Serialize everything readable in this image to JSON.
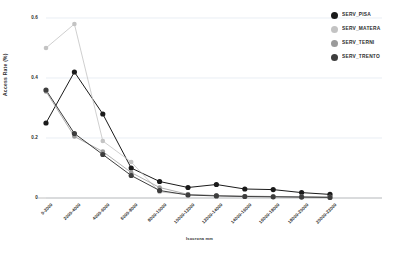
{
  "chart_data": {
    "type": "line",
    "title": "",
    "xlabel": "Isocrona mm",
    "ylabel": "Access Rate (%)",
    "ylim": [
      0,
      0.6
    ],
    "yticks": [
      0,
      0.2,
      0.4,
      0.6
    ],
    "ytick_labels": [
      "0",
      "0.2",
      "0.4",
      "0.6"
    ],
    "grid": "horizontal",
    "legend_position": "top-right",
    "categories": [
      "0-2000",
      "2000-4000",
      "4000-6000",
      "6000-8000",
      "8000-10000",
      "10000-12000",
      "12000-14000",
      "14000-16000",
      "16000-18000",
      "18000-20000",
      "20000-22000"
    ],
    "series": [
      {
        "name": "SERV_PISA",
        "color": "#1a1a1a",
        "values": [
          0.25,
          0.42,
          0.28,
          0.1,
          0.055,
          0.035,
          0.045,
          0.03,
          0.028,
          0.018,
          0.012
        ]
      },
      {
        "name": "SERV_MATERA",
        "color": "#c3c3c3",
        "values": [
          0.5,
          0.58,
          0.19,
          0.12,
          0.02,
          0.012,
          0.008,
          0.006,
          0.005,
          0.004,
          0.003
        ]
      },
      {
        "name": "SERV_TERNI",
        "color": "#9a9a9a",
        "values": [
          0.355,
          0.205,
          0.155,
          0.085,
          0.035,
          0.012,
          0.008,
          0.006,
          0.005,
          0.004,
          0.003
        ]
      },
      {
        "name": "SERV_TRENTO",
        "color": "#3d3d3d",
        "values": [
          0.36,
          0.215,
          0.145,
          0.075,
          0.025,
          0.01,
          0.007,
          0.005,
          0.004,
          0.003,
          0.002
        ]
      }
    ]
  },
  "legend": {
    "items": [
      {
        "label": "SERV_PISA",
        "color": "#1a1a1a"
      },
      {
        "label": "SERV_MATERA",
        "color": "#c3c3c3"
      },
      {
        "label": "SERV_TERNI",
        "color": "#9a9a9a"
      },
      {
        "label": "SERV_TRENTO",
        "color": "#3d3d3d"
      }
    ]
  },
  "axes": {
    "y_title": "Access Rate (%)",
    "x_title": "Isocrona mm"
  }
}
